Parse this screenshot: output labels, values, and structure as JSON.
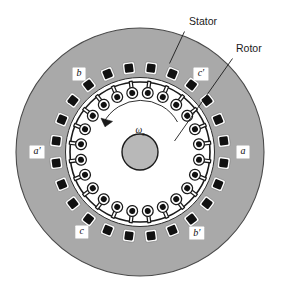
{
  "figure": {
    "callouts": [
      {
        "id": "stator",
        "label": "Stator"
      },
      {
        "id": "rotor",
        "label": "Rotor"
      }
    ],
    "phase_labels": [
      {
        "id": "b",
        "label": "b",
        "prime": "",
        "position": "upper-left"
      },
      {
        "id": "c-prime",
        "label": "c",
        "prime": "′",
        "position": "upper-right"
      },
      {
        "id": "a-prime",
        "label": "a",
        "prime": "′",
        "position": "left"
      },
      {
        "id": "a",
        "label": "a",
        "prime": "",
        "position": "right"
      },
      {
        "id": "c",
        "label": "c",
        "prime": "",
        "position": "lower-left"
      },
      {
        "id": "b-prime",
        "label": "b",
        "prime": "′",
        "position": "lower-right"
      }
    ],
    "rotation": {
      "symbol": "ω",
      "subscript": "s",
      "direction": "counterclockwise"
    },
    "geometry": {
      "stator_slot_count": 24,
      "rotor_slot_count": 24,
      "center_x": 140,
      "center_y": 152,
      "stator_outer_radius": 124,
      "stator_bore_radius": 74,
      "rotor_outer_radius": 70,
      "shaft_radius": 18
    },
    "colors": {
      "stator_fill": "#a9a9a9",
      "stator_edge": "#3a3a3a",
      "rotor_fill": "#ffffff",
      "slot_fill": "#111111",
      "slot_outline": "#ffffff",
      "shaft_fill": "#b8b8b8",
      "background": "#ffffff",
      "line": "#1a1a1a"
    }
  }
}
